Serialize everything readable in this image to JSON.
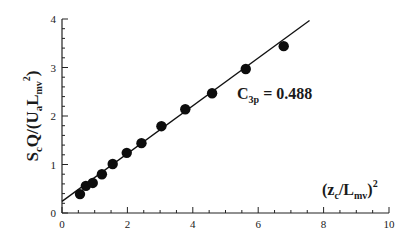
{
  "chart_data": {
    "type": "scatter",
    "title": "",
    "xlabel": {
      "open": "(z",
      "sub1": "c",
      "mid": "/L",
      "sub2": "mv",
      "close": ")",
      "sup": "2"
    },
    "ylabel": {
      "s": "S",
      "s_sub": "c",
      "mid": "Q/(U",
      "u_sub": "a",
      "l": "L",
      "l_sub": "mv",
      "l_sup": "2",
      "close": ")"
    },
    "xlim": [
      0,
      10
    ],
    "ylim": [
      0,
      4
    ],
    "x_major_ticks": [
      0,
      2,
      4,
      6,
      8,
      10
    ],
    "x_tick_labels": [
      "0",
      "2",
      "4",
      "6",
      "8",
      "10"
    ],
    "x_minor_step": 0.5,
    "y_major_ticks": [
      0,
      1,
      2,
      3,
      4
    ],
    "y_tick_labels": [
      "0",
      "1",
      "2",
      "3",
      "4"
    ],
    "y_minor_step": 0.2,
    "grid": false,
    "series": [
      {
        "name": "measurements",
        "marker": "filled-circle",
        "x": [
          0.55,
          0.73,
          0.94,
          1.22,
          1.55,
          1.98,
          2.43,
          3.04,
          3.77,
          4.59,
          5.62,
          6.78
        ],
        "y": [
          0.39,
          0.56,
          0.62,
          0.8,
          1.01,
          1.24,
          1.44,
          1.79,
          2.14,
          2.47,
          2.97,
          3.44
        ]
      },
      {
        "name": "linear fit",
        "type": "line",
        "x": [
          0,
          7.57
        ],
        "y": [
          0.24,
          3.97
        ]
      }
    ],
    "annotation": {
      "c": "C",
      "sub": "3p",
      "text": " = 0.488",
      "x": 4.4,
      "y": 2.0
    }
  }
}
